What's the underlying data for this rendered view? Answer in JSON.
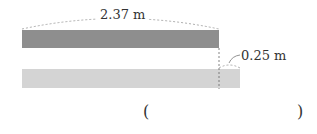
{
  "diagram": {
    "top_bar_label": "2.37 m",
    "difference_label": "0.25 m",
    "answer_open": "(",
    "answer_close": ")",
    "colors": {
      "top_bar": "#8e8e8e",
      "bottom_bar": "#d4d4d4",
      "line": "#8a8a8a",
      "text": "#333333"
    }
  }
}
